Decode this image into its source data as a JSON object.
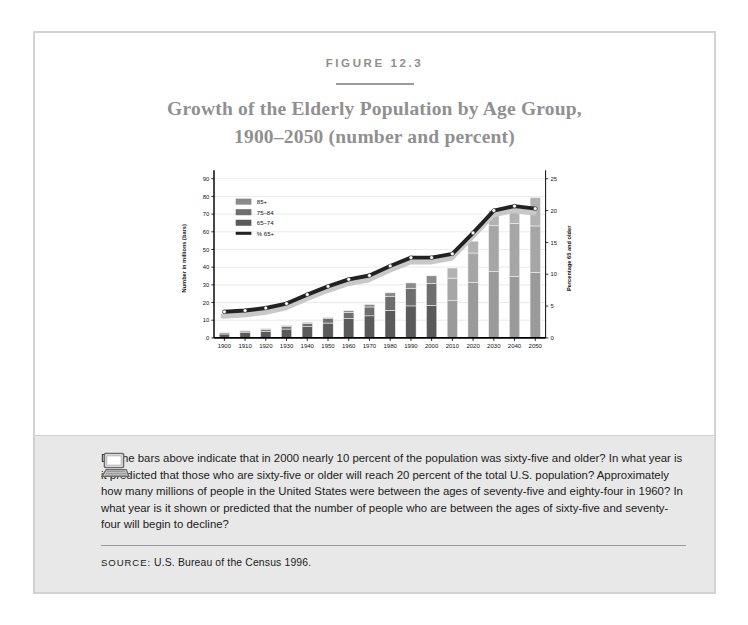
{
  "figure": {
    "label": "FIGURE 12.3",
    "title_line1": "Growth of the Elderly Population by Age Group,",
    "title_line2": "1900–2050 (number and percent)"
  },
  "note": {
    "icon": "computer-icon",
    "text": "Do the bars above indicate that in 2000 nearly 10 percent of the population was sixty-five and older? In what year is it predicted that those who are sixty-five or older will reach 20 percent of the total U.S. population? Approximately how many millions of people in the United States were between the ages of seventy-five and eighty-four in 1960? In what year is it shown or predicted that the number of people who are between the ages of sixty-five and seventy-four will begin to decline?",
    "source_prefix": "SOURCE:",
    "source_value": "U.S. Bureau of the Census 1996."
  },
  "colors": {
    "bar_65_74_historic": "#5a5a5a",
    "bar_75_84_historic": "#6e6e6e",
    "bar_85_plus_historic": "#8a8a8a",
    "bar_65_74_projected": "#9a9a9a",
    "bar_75_84_projected": "#a6a6a6",
    "bar_85_plus_projected": "#b2b2b2",
    "line": "#222222",
    "line_shadow": "#c8c8c8",
    "marker": "#ffffff",
    "grid": "#dcdcdc",
    "axis": "#000000",
    "panel_bg": "#e8e8e8",
    "frame": "#d2d2d2",
    "title": "#909090"
  },
  "chart_data": {
    "type": "bar",
    "title": "Growth of the Elderly Population by Age Group, 1900–2050 (number and percent)",
    "xlabel": "",
    "ylabel": "Number in millions (bars)",
    "y2label": "Percentage 65 and older",
    "ylim": [
      0,
      90
    ],
    "y2lim": [
      0,
      25
    ],
    "yticks": [
      0,
      10,
      20,
      30,
      40,
      50,
      60,
      70,
      80,
      90
    ],
    "y2ticks": [
      0,
      5,
      10,
      15,
      20,
      25
    ],
    "grid": true,
    "legend_position": "upper-left",
    "categories": [
      "1900",
      "1910",
      "1920",
      "1930",
      "1940",
      "1950",
      "1960",
      "1970",
      "1980",
      "1990",
      "2000",
      "2010",
      "2020",
      "2030",
      "2040",
      "2050"
    ],
    "series": [
      {
        "name": "65–74",
        "key": "s65_74",
        "values": [
          2.2,
          3.0,
          3.8,
          5.0,
          6.4,
          8.4,
          11.0,
          12.5,
          15.6,
          18.1,
          18.4,
          21.1,
          31.4,
          37.5,
          34.7,
          37.1
        ]
      },
      {
        "name": "75–84",
        "key": "s75_84",
        "values": [
          0.7,
          0.9,
          1.1,
          1.6,
          1.9,
          2.5,
          3.5,
          5.0,
          7.7,
          10.0,
          12.4,
          12.7,
          16.6,
          25.9,
          30.1,
          26.2
        ]
      },
      {
        "name": "85+",
        "key": "s85_plus",
        "values": [
          0.1,
          0.2,
          0.3,
          0.4,
          0.5,
          0.6,
          0.9,
          1.4,
          2.2,
          3.0,
          4.3,
          5.7,
          6.7,
          8.5,
          10.4,
          16.0
        ]
      }
    ],
    "line_series": {
      "name": "% 65+",
      "key": "pct65plus",
      "axis": "right",
      "values": [
        4.1,
        4.3,
        4.7,
        5.4,
        6.8,
        8.1,
        9.2,
        9.8,
        11.3,
        12.6,
        12.6,
        13.2,
        16.5,
        20.0,
        20.7,
        20.3
      ]
    },
    "legend": [
      {
        "label": "85+",
        "swatch": "#8a8a8a",
        "type": "box"
      },
      {
        "label": "75–84",
        "swatch": "#6e6e6e",
        "type": "box"
      },
      {
        "label": "65–74",
        "swatch": "#5a5a5a",
        "type": "box"
      },
      {
        "label": "% 65+",
        "swatch": "#222222",
        "type": "line"
      }
    ],
    "projection_starts_at": "2010"
  }
}
